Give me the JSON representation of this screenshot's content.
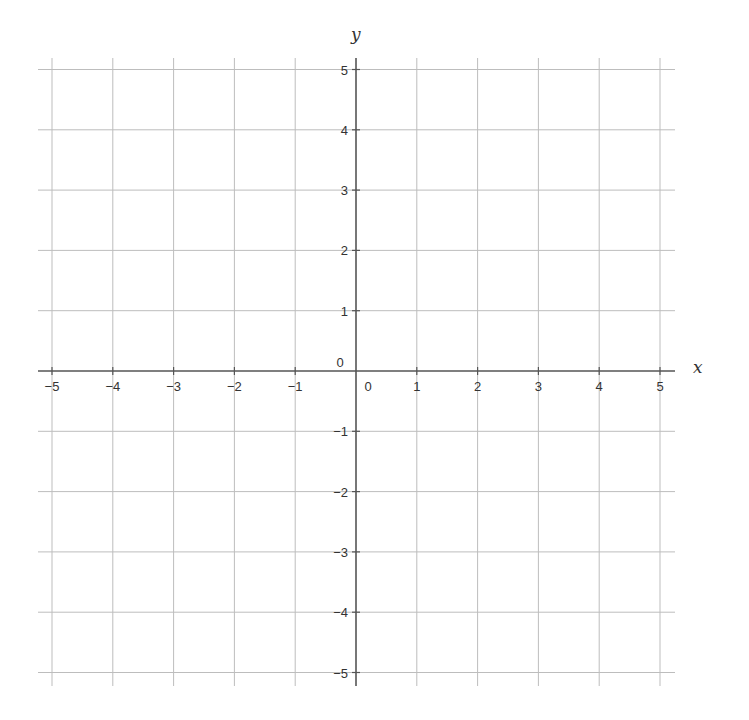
{
  "chart_data": {
    "type": "line",
    "title": "",
    "xlabel": "x",
    "ylabel": "y",
    "xlim": [
      -5,
      5
    ],
    "ylim": [
      -5,
      5
    ],
    "grid": true,
    "x_ticks": [
      "−5",
      "−4",
      "−3",
      "−2",
      "−1",
      "0",
      "1",
      "2",
      "3",
      "4",
      "5"
    ],
    "y_ticks": [
      "−5",
      "−4",
      "−3",
      "−2",
      "−1",
      "0",
      "1",
      "2",
      "3",
      "4",
      "5"
    ],
    "series": []
  },
  "style": {
    "grid_color": "#bdbdbd",
    "axis_color": "#555555",
    "text_color": "#333333",
    "background": "#ffffff"
  }
}
